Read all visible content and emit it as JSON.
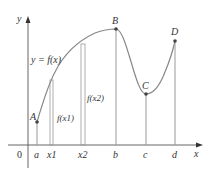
{
  "diagram": {
    "function_label": "y = f(x)",
    "axes": {
      "x_label": "x",
      "y_label": "y",
      "origin_label": "0"
    },
    "points": [
      {
        "name": "A",
        "x_tick": "a"
      },
      {
        "name": "B",
        "x_tick": "b"
      },
      {
        "name": "C",
        "x_tick": "c"
      },
      {
        "name": "D",
        "x_tick": "d"
      }
    ],
    "x_ticks": [
      "a",
      "x1",
      "x2",
      "b",
      "c",
      "d"
    ],
    "value_labels": [
      "f(x1)",
      "f(x2)"
    ],
    "colors": {
      "curve": "#888888",
      "axis": "#555555",
      "points": "#444444"
    }
  }
}
